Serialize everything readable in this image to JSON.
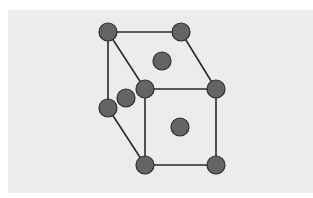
{
  "diagram": {
    "title": "",
    "type": "crystal-lattice-unit-cell",
    "colors": {
      "background": "#ececec",
      "page": "#ffffff",
      "atom_fill": "#646464",
      "atom_stroke": "#2e2e2e",
      "edge": "#2a2a2a"
    },
    "atom_radius": 9,
    "atoms": [
      {
        "id": "back-top-left",
        "x": 108,
        "y": 32
      },
      {
        "id": "back-top-right",
        "x": 181,
        "y": 32
      },
      {
        "id": "top-face-center",
        "x": 162,
        "y": 61
      },
      {
        "id": "front-top-left",
        "x": 145,
        "y": 89
      },
      {
        "id": "front-top-right",
        "x": 216,
        "y": 89
      },
      {
        "id": "left-face-center",
        "x": 126,
        "y": 98
      },
      {
        "id": "back-bottom-left",
        "x": 108,
        "y": 108
      },
      {
        "id": "front-face-center",
        "x": 180,
        "y": 127
      },
      {
        "id": "front-bottom-left",
        "x": 145,
        "y": 165
      },
      {
        "id": "front-bottom-right",
        "x": 216,
        "y": 165
      }
    ],
    "edges": [
      {
        "from": "back-top-left",
        "to": "back-top-right"
      },
      {
        "from": "back-top-left",
        "to": "front-top-left"
      },
      {
        "from": "back-top-right",
        "to": "front-top-right"
      },
      {
        "from": "front-top-left",
        "to": "front-top-right"
      },
      {
        "from": "back-top-left",
        "to": "back-bottom-left"
      },
      {
        "from": "back-bottom-left",
        "to": "front-bottom-left"
      },
      {
        "from": "front-top-left",
        "to": "front-bottom-left"
      },
      {
        "from": "front-top-right",
        "to": "front-bottom-right"
      },
      {
        "from": "front-bottom-left",
        "to": "front-bottom-right"
      }
    ]
  }
}
